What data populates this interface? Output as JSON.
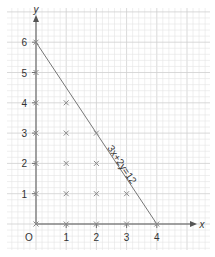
{
  "chart_data": {
    "type": "scatter",
    "title": "",
    "xlabel": "x",
    "ylabel": "y",
    "origin_label": "O",
    "xlim": [
      0,
      4
    ],
    "ylim": [
      0,
      6
    ],
    "x_ticks": [
      "1",
      "2",
      "3",
      "4"
    ],
    "y_ticks": [
      "1",
      "2",
      "3",
      "4",
      "5",
      "6"
    ],
    "grid": true,
    "line": {
      "label": "3x+2y=12",
      "from": [
        0,
        6
      ],
      "to": [
        4,
        0
      ]
    },
    "points": [
      [
        0,
        0
      ],
      [
        0,
        1
      ],
      [
        0,
        2
      ],
      [
        0,
        3
      ],
      [
        0,
        4
      ],
      [
        0,
        5
      ],
      [
        0,
        6
      ],
      [
        1,
        0
      ],
      [
        1,
        1
      ],
      [
        1,
        2
      ],
      [
        1,
        3
      ],
      [
        1,
        4
      ],
      [
        2,
        0
      ],
      [
        2,
        1
      ],
      [
        2,
        2
      ],
      [
        2,
        3
      ],
      [
        3,
        0
      ],
      [
        3,
        1
      ],
      [
        4,
        0
      ]
    ],
    "marker": "x"
  },
  "colors": {
    "grid_minor": "#e4e4e4",
    "grid_major": "#cfcfcf",
    "axis": "#555555",
    "line": "#777777",
    "marker": "#888888"
  }
}
